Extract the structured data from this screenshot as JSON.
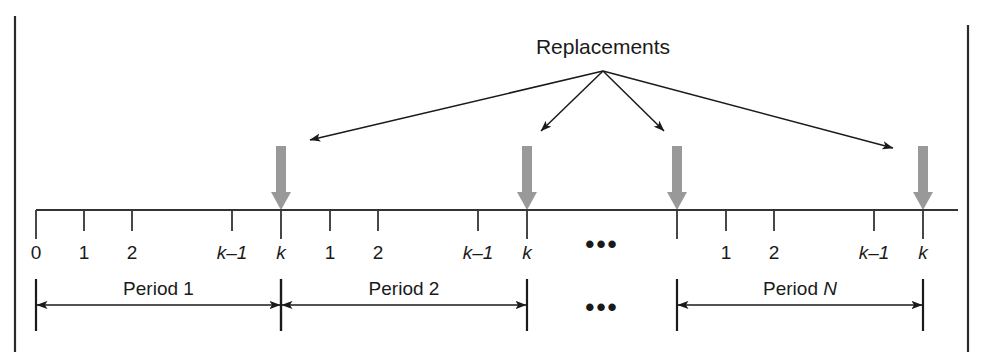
{
  "figure": {
    "title": "Replacements",
    "frame_color": "#2b2b2b",
    "axis_color": "#333333",
    "marker_color": "#999999",
    "arrow_color": "#1a1a1a"
  },
  "axis": {
    "y": 210,
    "x_start": 36,
    "x_end": 958,
    "ticks": [
      {
        "x": 36,
        "label": "0",
        "italic": false,
        "long": true
      },
      {
        "x": 84,
        "label": "1",
        "italic": false,
        "long": false
      },
      {
        "x": 132,
        "label": "2",
        "italic": false,
        "long": false
      },
      {
        "x": 232,
        "label": "k–1",
        "italic": true,
        "long": false
      },
      {
        "x": 281,
        "label": "k",
        "italic": true,
        "long": true
      },
      {
        "x": 330,
        "label": "1",
        "italic": false,
        "long": false
      },
      {
        "x": 378,
        "label": "2",
        "italic": false,
        "long": false
      },
      {
        "x": 478,
        "label": "k–1",
        "italic": true,
        "long": false
      },
      {
        "x": 527,
        "label": "k",
        "italic": true,
        "long": true
      },
      {
        "x": 677,
        "label": "",
        "italic": false,
        "long": true
      },
      {
        "x": 726,
        "label": "1",
        "italic": false,
        "long": false
      },
      {
        "x": 774,
        "label": "2",
        "italic": false,
        "long": false
      },
      {
        "x": 874,
        "label": "k–1",
        "italic": true,
        "long": false
      },
      {
        "x": 923,
        "label": "k",
        "italic": true,
        "long": true
      }
    ],
    "ellipsis": {
      "x": 602,
      "text": "•••"
    }
  },
  "replacement_markers": [
    {
      "x": 281
    },
    {
      "x": 527
    },
    {
      "x": 677
    },
    {
      "x": 923
    }
  ],
  "callout": {
    "label": "Replacements",
    "origin": {
      "x": 603,
      "y": 71
    },
    "targets": [
      {
        "x": 310,
        "y": 140
      },
      {
        "x": 541,
        "y": 131
      },
      {
        "x": 664,
        "y": 131
      },
      {
        "x": 893,
        "y": 148
      }
    ]
  },
  "periods": [
    {
      "label": "Period 1",
      "italic_suffix": "",
      "x_start": 36,
      "x_end": 281
    },
    {
      "label": "Period 2",
      "italic_suffix": "",
      "x_start": 281,
      "x_end": 527
    },
    {
      "label": "Period ",
      "italic_suffix": "N",
      "x_start": 677,
      "x_end": 923
    }
  ],
  "period_ellipsis": {
    "x": 602,
    "text": "•••"
  }
}
